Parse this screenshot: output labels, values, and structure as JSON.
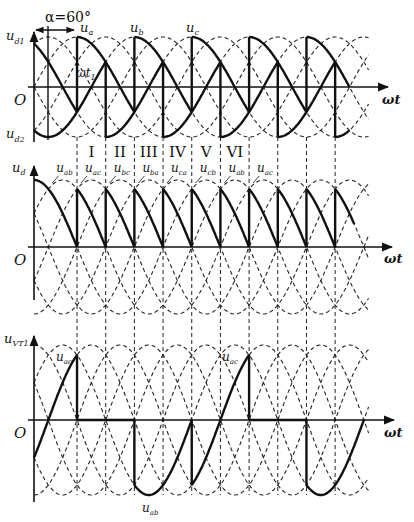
{
  "figure": {
    "alpha_label": "α=60°",
    "alpha_deg": 60,
    "x_axis_label": "ωt",
    "origin_label": "O",
    "colors": {
      "ink": "#111111",
      "background": "#ffffff"
    }
  },
  "panels": [
    {
      "id": "phase-voltages",
      "y_labels": [
        "u_d1",
        "u_d2"
      ],
      "curve_labels": [
        "u_a",
        "u_b",
        "u_c"
      ],
      "annotation": "ωt1",
      "intervals": [
        "I",
        "II",
        "III",
        "IV",
        "V",
        "VI"
      ]
    },
    {
      "id": "output-voltage",
      "y_label": "u_d",
      "curve_labels": [
        "u_ab",
        "u_ac",
        "u_bc",
        "u_ba",
        "u_ca",
        "u_cb",
        "u_ab",
        "u_ac"
      ]
    },
    {
      "id": "thyristor-voltage",
      "y_label": "u_VT1",
      "curve_labels": [
        "u_ac",
        "u_ac",
        "u_ab"
      ]
    }
  ],
  "labels": {
    "ud1": "u",
    "ud1_sub": "d1",
    "ud2": "u",
    "ud2_sub": "d2",
    "ua": "u",
    "ua_sub": "a",
    "ub": "u",
    "ub_sub": "b",
    "uc": "u",
    "uc_sub": "c",
    "wt1": "ωt",
    "wt1_sub": "1",
    "ud": "u",
    "ud_sub": "d",
    "uvt": "u",
    "uvt_sub": "VT1",
    "iv": [
      "I",
      "II",
      "III",
      "IV",
      "V",
      "VI"
    ],
    "mid_curves": [
      {
        "t": "u",
        "s": "ab"
      },
      {
        "t": "u",
        "s": "ac"
      },
      {
        "t": "u",
        "s": "bc"
      },
      {
        "t": "u",
        "s": "ba"
      },
      {
        "t": "u",
        "s": "ca"
      },
      {
        "t": "u",
        "s": "cb"
      },
      {
        "t": "u",
        "s": "ab"
      },
      {
        "t": "u",
        "s": "ac"
      }
    ],
    "bot_uac1": "u",
    "bot_uac1_sub": "ac",
    "bot_uac2": "u",
    "bot_uac2_sub": "ac",
    "bot_uab": "u",
    "bot_uab_sub": "ab",
    "wt": "ωt",
    "O": "O",
    "alpha": "α=60°"
  },
  "geometry": {
    "x0": 34,
    "px_per_deg": 0.478,
    "x_end_deg": 700,
    "top": {
      "zero": 87,
      "amp": 50
    },
    "mid": {
      "zero": 247,
      "amp": 67
    },
    "bot": {
      "zero": 420,
      "amp": 75
    }
  }
}
